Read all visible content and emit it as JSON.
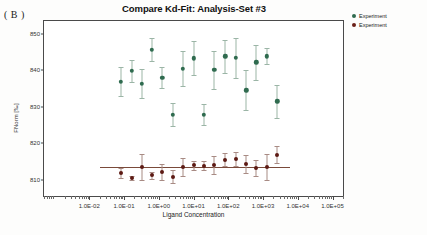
{
  "panel_label": "( B )",
  "legend": {
    "entries": [
      {
        "label": "Experiment",
        "color": "#2f6b4f"
      },
      {
        "label": "Experiment",
        "color": "#6b2018"
      }
    ]
  },
  "chart_data": {
    "type": "scatter",
    "title": "Compare Kd-Fit: Analysis-Set #3",
    "xlabel": "Ligand Concentration",
    "ylabel": "FNorm [‰]",
    "xscale": "log",
    "xlim": [
      0.0005,
      200000
    ],
    "ylim": [
      805.5,
      853.5
    ],
    "grid": false,
    "legend_position": "right",
    "xticks": [
      "1.0E-02",
      "1.0E-01",
      "1.0E+00",
      "1.0E+01",
      "1.0E+02",
      "1.0E+03",
      "1.0E+04",
      "1.0E+05"
    ],
    "xtick_values": [
      0.01,
      0.1,
      1,
      10,
      100,
      1000,
      10000,
      100000
    ],
    "yticks": [
      810,
      820,
      830,
      840,
      850
    ],
    "series": [
      {
        "name": "Experiment",
        "color": "#2f6b4f",
        "errorbar_color": "#9bb5a6",
        "x": [
          0.082,
          0.17,
          0.33,
          0.62,
          1.25,
          2.5,
          5.0,
          10.0,
          20.0,
          40.0,
          82.0,
          165.0,
          330.0,
          640.0,
          1300.0,
          2600.0
        ],
        "y": [
          836.9,
          839.9,
          836.3,
          845.6,
          837.9,
          827.8,
          840.4,
          843.3,
          827.8,
          840.1,
          843.8,
          843.4,
          834.5,
          842.2,
          843.8,
          831.5
        ],
        "yerr": [
          4.0,
          3.0,
          4.0,
          3.2,
          2.9,
          3.1,
          4.8,
          4.6,
          2.9,
          5.2,
          4.5,
          5.5,
          5.5,
          4.8,
          2.2,
          4.5
        ]
      },
      {
        "name": "Experiment",
        "color": "#5d1a14",
        "errorbar_color": "#a88b84",
        "x": [
          0.082,
          0.17,
          0.33,
          0.62,
          1.25,
          2.5,
          5.0,
          10.0,
          20.0,
          40.0,
          82.0,
          165.0,
          330.0,
          640.0,
          1300.0,
          2600.0
        ],
        "y": [
          811.8,
          810.5,
          813.4,
          811.2,
          812.1,
          810.8,
          813.4,
          813.9,
          813.8,
          814.0,
          815.5,
          815.6,
          814.3,
          813.3,
          813.4,
          816.8
        ],
        "yerr": [
          1.4,
          0.6,
          3.6,
          0.9,
          2.2,
          1.8,
          2.4,
          1.3,
          1.3,
          2.4,
          1.8,
          2.0,
          2.4,
          2.2,
          3.6,
          2.3
        ]
      }
    ],
    "fit_line": {
      "name": "Kd fit",
      "color": "#7a4a3a",
      "value": 813.5
    }
  }
}
